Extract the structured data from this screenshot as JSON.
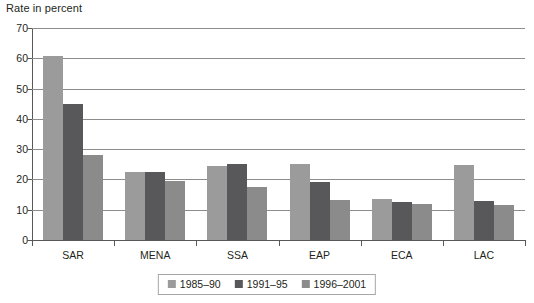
{
  "chart_data": {
    "type": "bar",
    "title": "",
    "ylabel": "Rate in percent",
    "xlabel": "",
    "ylim": [
      0,
      70
    ],
    "yticks": [
      0,
      10,
      20,
      30,
      40,
      50,
      60,
      70
    ],
    "grid": true,
    "legend_position": "bottom",
    "categories": [
      "SAR",
      "MENA",
      "SSA",
      "EAP",
      "ECA",
      "LAC"
    ],
    "series": [
      {
        "name": "1985–90",
        "color": "#9b9b9b",
        "values": [
          60.7,
          22.3,
          24.5,
          25.0,
          13.5,
          24.8
        ]
      },
      {
        "name": "1991–95",
        "color": "#58585a",
        "values": [
          44.8,
          22.3,
          25.0,
          19.0,
          12.4,
          13.0
        ]
      },
      {
        "name": "1996–2001",
        "color": "#8b8b8b",
        "values": [
          28.0,
          19.5,
          17.5,
          13.2,
          11.8,
          11.4
        ]
      }
    ]
  },
  "axis": {
    "y_title": "Rate in percent"
  },
  "colors": {
    "series_1": "#9b9b9b",
    "series_2": "#58585a",
    "series_3": "#8b8b8b",
    "axis": "#58585a",
    "grid": "#8d8d8d",
    "text": "#231f20",
    "background": "#ffffff"
  }
}
